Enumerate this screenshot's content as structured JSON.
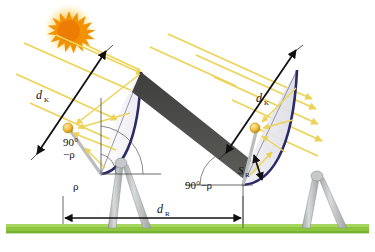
{
  "figure": {
    "type": "technical-diagram",
    "background_color": "#ffffff",
    "ground_color": "#8cc63f",
    "ray_color": "#f2dd6e",
    "dish_rim_color": "#2a2a6a",
    "shadow_color": "#4a4a4a",
    "sun_color": "#f39200",
    "sun_glow_color": "#fbd96b",
    "stand_color": "#b9bdbd",
    "receiver_color": "#f0c040",
    "dimension_color": "#111111"
  },
  "labels": {
    "d_k_left": {
      "symbol": "d",
      "subscript": "K"
    },
    "d_k_right": {
      "symbol": "d",
      "subscript": "K"
    },
    "d_r": {
      "symbol": "d",
      "subscript": "R"
    },
    "s_r": {
      "symbol": "S",
      "subscript": "R"
    },
    "angle_left_line1": "90°",
    "angle_left_line2": "−ρ",
    "angle_left_rho": "ρ",
    "angle_right": "90°−ρ"
  },
  "elements": {
    "sun_name": "sun",
    "left_collector_name": "left-parabolic-collector",
    "right_collector_name": "right-parabolic-collector",
    "shadow_name": "shadow-band",
    "ground_name": "ground-strip"
  }
}
